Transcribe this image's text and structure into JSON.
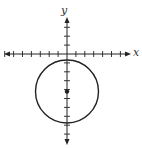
{
  "diagram": {
    "type": "circle-on-coordinate-plane",
    "axes": {
      "x_label": "x",
      "y_label": "y",
      "origin_px": [
        67,
        54
      ],
      "tick_spacing_px": 8.9,
      "x_ticks_left": 7,
      "x_ticks_right": 6,
      "y_ticks_up": 3,
      "y_ticks_down": 9,
      "x_range_px": [
        4,
        131
      ],
      "y_range_px": [
        17,
        145
      ]
    },
    "circle": {
      "center_px": [
        67,
        91.5
      ],
      "radius_px": 31.5,
      "center_units_estimate": [
        0,
        -4
      ],
      "radius_units_estimate": 3.5,
      "center_marked": true
    },
    "colors": {
      "line": "#222222",
      "background": "#ffffff"
    }
  }
}
